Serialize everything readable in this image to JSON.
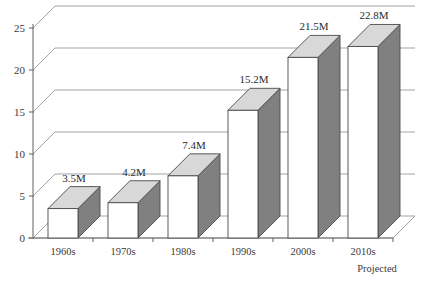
{
  "chart_data": {
    "type": "bar",
    "title": "",
    "subtitle": "",
    "xlabel": "",
    "ylabel": "",
    "categories": [
      "1960s",
      "1970s",
      "1980s",
      "1990s",
      "2000s",
      "2010s"
    ],
    "values": [
      3.5,
      4.2,
      7.4,
      15.2,
      21.5,
      22.8
    ],
    "data_labels": [
      "3.5M",
      "4.2M",
      "7.4M",
      "15.2M",
      "21.5M",
      "22.8M"
    ],
    "ylim": [
      0,
      25
    ],
    "y_ticks": [
      "0",
      "5",
      "10",
      "15",
      "20",
      "25"
    ],
    "y_tick_values": [
      0,
      5,
      10,
      15,
      20,
      25
    ],
    "grid": true,
    "legend": false,
    "legend_position": "none",
    "annotations": [
      {
        "text": "Projected",
        "attached_to": "2010s"
      }
    ],
    "style": {
      "three_d": true,
      "bar_front_color": "#ffffff",
      "bar_side_color": "#808080",
      "bar_top_color": "#d8d8d8",
      "bar_outline_color": "#4a4a4a",
      "grid_color": "#9a9a9a",
      "axis_color": "#6e6e6e",
      "background_color": "#ffffff",
      "text_color": "#3a3a3a"
    }
  }
}
